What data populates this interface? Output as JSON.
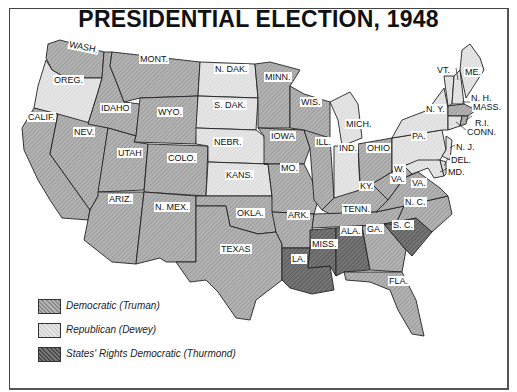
{
  "title": "PRESIDENTIAL ELECTION, 1948",
  "colors": {
    "democratic": "#a9a9a9",
    "republican": "#e2e2e2",
    "states_rights": "#6a6a6a",
    "border": "#222222"
  },
  "legend": [
    {
      "key": "democratic",
      "label": "Democratic (Truman)"
    },
    {
      "key": "republican",
      "label": "Republican (Dewey)"
    },
    {
      "key": "states_rights",
      "label": "States' Rights Democratic (Thurmond)"
    }
  ],
  "states": {
    "wash": {
      "label": "WASH.",
      "party": "democratic"
    },
    "oreg": {
      "label": "OREG.",
      "party": "republican"
    },
    "calif": {
      "label": "CALIF.",
      "party": "democratic"
    },
    "idaho": {
      "label": "IDAHO",
      "party": "democratic"
    },
    "nev": {
      "label": "NEV.",
      "party": "democratic"
    },
    "mont": {
      "label": "MONT.",
      "party": "democratic"
    },
    "wyo": {
      "label": "WYO.",
      "party": "democratic"
    },
    "utah": {
      "label": "UTAH",
      "party": "democratic"
    },
    "colo": {
      "label": "COLO.",
      "party": "democratic"
    },
    "ariz": {
      "label": "ARIZ.",
      "party": "democratic"
    },
    "nmex": {
      "label": "N. MEX.",
      "party": "democratic"
    },
    "ndak": {
      "label": "N. DAK.",
      "party": "republican"
    },
    "sdak": {
      "label": "S. DAK.",
      "party": "republican"
    },
    "nebr": {
      "label": "NEBR.",
      "party": "republican"
    },
    "kans": {
      "label": "KANS.",
      "party": "republican"
    },
    "okla": {
      "label": "OKLA.",
      "party": "democratic"
    },
    "texas": {
      "label": "TEXAS",
      "party": "democratic"
    },
    "minn": {
      "label": "MINN.",
      "party": "democratic"
    },
    "iowa": {
      "label": "IOWA",
      "party": "democratic"
    },
    "mo": {
      "label": "MO.",
      "party": "democratic"
    },
    "ark": {
      "label": "ARK.",
      "party": "democratic"
    },
    "la": {
      "label": "LA.",
      "party": "states_rights"
    },
    "wis": {
      "label": "WIS.",
      "party": "democratic"
    },
    "ill": {
      "label": "ILL.",
      "party": "democratic"
    },
    "mich": {
      "label": "MICH.",
      "party": "republican"
    },
    "ind": {
      "label": "IND.",
      "party": "republican"
    },
    "ohio": {
      "label": "OHIO",
      "party": "democratic"
    },
    "ky": {
      "label": "KY.",
      "party": "democratic"
    },
    "tenn": {
      "label": "TENN.",
      "party": "democratic"
    },
    "miss": {
      "label": "MISS.",
      "party": "states_rights"
    },
    "ala": {
      "label": "ALA.",
      "party": "states_rights"
    },
    "ga": {
      "label": "GA.",
      "party": "democratic"
    },
    "fla": {
      "label": "FLA.",
      "party": "democratic"
    },
    "sc": {
      "label": "S. C.",
      "party": "states_rights"
    },
    "nc": {
      "label": "N. C.",
      "party": "democratic"
    },
    "va": {
      "label": "VA.",
      "party": "democratic"
    },
    "wva": {
      "label_line1": "W.",
      "label_line2": "VA.",
      "party": "democratic"
    },
    "pa": {
      "label": "PA.",
      "party": "republican"
    },
    "ny": {
      "label": "N. Y.",
      "party": "republican"
    },
    "vt": {
      "label": "VT.",
      "party": "republican"
    },
    "nh": {
      "label": "N. H.",
      "party": "republican"
    },
    "me": {
      "label": "ME.",
      "party": "republican"
    },
    "mass": {
      "label": "MASS.",
      "party": "democratic"
    },
    "ri": {
      "label": "R.I.",
      "party": "democratic"
    },
    "conn": {
      "label": "CONN.",
      "party": "republican"
    },
    "nj": {
      "label": "N. J.",
      "party": "republican"
    },
    "del": {
      "label": "DEL.",
      "party": "republican"
    },
    "md": {
      "label": "MD.",
      "party": "republican"
    }
  }
}
